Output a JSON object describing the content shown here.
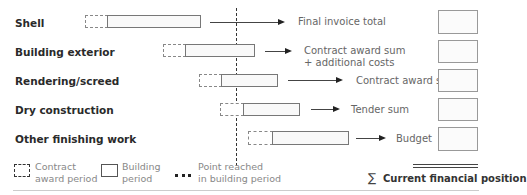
{
  "rows": [
    {
      "label": "Shell",
      "outcome": "Final invoice total"
    },
    {
      "label": "Building exterior",
      "outcome_line1": "Contract award sum",
      "outcome_line2": "+ additional costs"
    },
    {
      "label": "Rendering/screed",
      "outcome": "Contract award sum"
    },
    {
      "label": "Dry construction",
      "outcome": "Tender sum"
    },
    {
      "label": "Other finishing work",
      "outcome": "Budget"
    }
  ],
  "legend": {
    "contract_award": {
      "line1": "Contract",
      "line2": "award period",
      "icon": "dashed-box-icon"
    },
    "building": {
      "line1": "Building",
      "line2": "period",
      "icon": "solid-box-icon"
    },
    "point": {
      "line1": "Point reached",
      "line2": "in building period",
      "icon": "dotted-line-icon"
    },
    "sum": {
      "symbol": "∑",
      "label": "Current financial position"
    }
  },
  "colors": {
    "line": "#333333",
    "box_border": "#777777",
    "text_muted": "#888888"
  }
}
